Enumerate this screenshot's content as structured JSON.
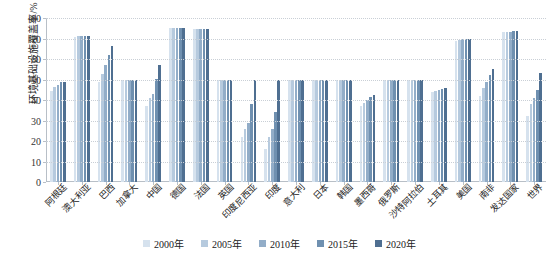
{
  "chart_data": {
    "type": "bar",
    "title": "",
    "subtitle": "",
    "xlabel": "",
    "ylabel": "环境基础设施覆盖率/%",
    "ylim": [
      0,
      80
    ],
    "yticks": [
      0,
      10,
      20,
      30,
      40,
      50,
      60,
      70,
      80
    ],
    "grid": true,
    "legend_position": "bottom",
    "categories": [
      "阿根廷",
      "澳大利亚",
      "巴西",
      "加拿大",
      "中国",
      "德国",
      "法国",
      "英国",
      "印度尼西亚",
      "印度",
      "意大利",
      "日本",
      "韩国",
      "墨西哥",
      "俄罗斯",
      "沙特阿拉伯",
      "土耳其",
      "美国",
      "南非",
      "发达国家",
      "世界"
    ],
    "series": [
      {
        "name": "2000年",
        "color": "#d6e2ee",
        "values": [
          44.2,
          70.8,
          48.8,
          50.0,
          37.2,
          75.0,
          74.6,
          50.0,
          22.0,
          16.0,
          50.0,
          50.0,
          50.0,
          37.0,
          50.0,
          50.0,
          44.0,
          69.0,
          42.0,
          73.0,
          32.0
        ]
      },
      {
        "name": "2005年",
        "color": "#b6cade",
        "values": [
          46.4,
          71.0,
          52.8,
          50.0,
          41.0,
          75.0,
          74.6,
          50.0,
          26.0,
          22.0,
          50.0,
          50.0,
          50.0,
          38.6,
          50.0,
          50.0,
          44.6,
          69.4,
          46.0,
          73.2,
          38.0
        ]
      },
      {
        "name": "2010年",
        "color": "#92adc8",
        "values": [
          47.2,
          71.2,
          57.2,
          50.0,
          43.0,
          75.0,
          74.6,
          50.0,
          29.0,
          26.0,
          50.0,
          50.0,
          50.0,
          40.0,
          50.0,
          50.0,
          45.0,
          69.6,
          49.0,
          73.4,
          41.0
        ]
      },
      {
        "name": "2015年",
        "color": "#6f90b0",
        "values": [
          48.6,
          71.4,
          62.2,
          50.0,
          50.4,
          75.0,
          74.8,
          50.0,
          38.0,
          34.0,
          50.0,
          50.0,
          50.0,
          41.4,
          50.0,
          50.0,
          45.4,
          70.0,
          52.0,
          73.6,
          45.0
        ]
      },
      {
        "name": "2020年",
        "color": "#4f6f91",
        "values": [
          49.0,
          71.4,
          66.4,
          50.0,
          57.0,
          75.0,
          74.8,
          50.0,
          50.0,
          50.0,
          50.0,
          50.0,
          50.0,
          42.4,
          50.0,
          50.0,
          46.0,
          70.0,
          55.0,
          73.8,
          53.0
        ]
      }
    ]
  },
  "axis": {
    "y_title": "环境基础设施覆盖率/%"
  }
}
